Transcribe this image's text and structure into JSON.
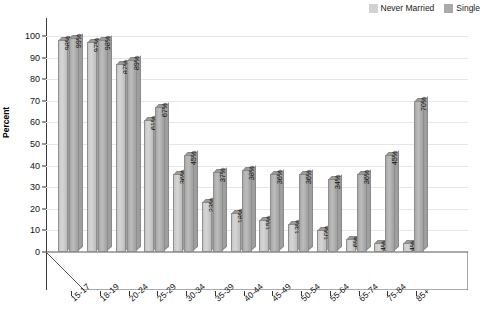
{
  "axis": {
    "ylabel": "Percent",
    "yticks": [
      "0",
      "10",
      "20",
      "30",
      "40",
      "50",
      "60",
      "70",
      "80",
      "90",
      "100"
    ]
  },
  "legend": {
    "items": [
      {
        "label": "Never Married",
        "swatch": "#d2d2d2",
        "icon": "legend-swatch-icon"
      },
      {
        "label": "Single",
        "swatch": "#aaaaaa",
        "icon": "legend-swatch-icon"
      }
    ]
  },
  "chart_data": {
    "type": "bar",
    "title": "",
    "xlabel": "",
    "ylabel": "Percent",
    "ylim": [
      0,
      100
    ],
    "grid": true,
    "legend_position": "top-right",
    "categories": [
      "15-17",
      "18-19",
      "20-24",
      "25-29",
      "30-34",
      "35-39",
      "40-44",
      "45-49",
      "50-54",
      "55-64",
      "65-74",
      "75-84",
      "85+"
    ],
    "series": [
      {
        "name": "Never Married",
        "color": "#d2d2d2",
        "values": [
          98,
          97,
          87,
          61,
          36,
          23,
          18,
          15,
          13,
          10,
          6,
          4,
          4
        ],
        "labels": [
          "98%",
          "97%",
          "87%",
          "61%",
          "36%",
          "23%",
          "18%",
          "15%",
          "13%",
          "10%",
          "6%",
          "4%",
          "4%"
        ]
      },
      {
        "name": "Single",
        "color": "#aaaaaa",
        "values": [
          99,
          98,
          89,
          67,
          45,
          37,
          38,
          36,
          36,
          34,
          36,
          45,
          70
        ],
        "labels": [
          "99%",
          "98%",
          "89%",
          "67%",
          "45%",
          "37%",
          "38%",
          "36%",
          "36%",
          "34%",
          "36%",
          "45%",
          "70%"
        ]
      }
    ]
  }
}
